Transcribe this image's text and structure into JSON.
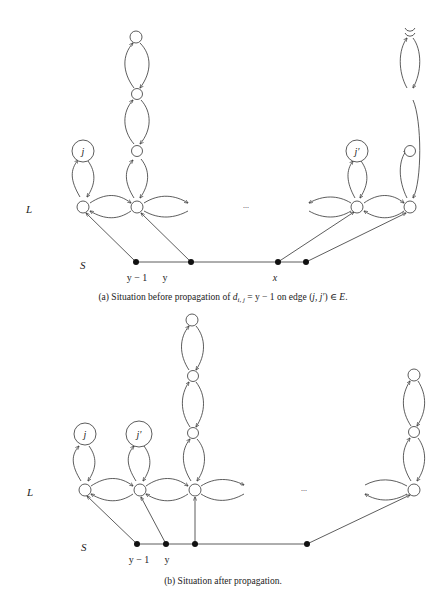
{
  "panel_a": {
    "row_labels": {
      "L": "L",
      "S": "S"
    },
    "node_labels": {
      "j": "j",
      "j_prime": "j′"
    },
    "s_labels": {
      "y_minus_1": "y − 1",
      "y": "y",
      "x": "x"
    },
    "ellipsis": "...",
    "caption": {
      "prefix": "(a)  Situation before propagation of ",
      "d": "d",
      "sub": "i, j",
      "mid": " = y − 1 on edge (",
      "edge": "j, j′",
      "suffix": ") ∈ ",
      "set": "E",
      "end": "."
    }
  },
  "panel_b": {
    "row_labels": {
      "L": "L",
      "S": "S"
    },
    "node_labels": {
      "j": "j",
      "j_prime": "j′"
    },
    "s_labels": {
      "y_minus_1": "y − 1",
      "y": "y"
    },
    "ellipsis": "...",
    "caption": "(b)  Situation after propagation."
  }
}
